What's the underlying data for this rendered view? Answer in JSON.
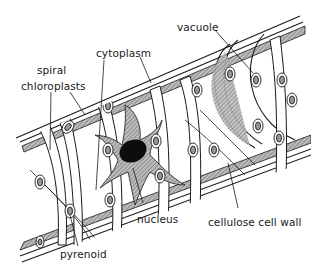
{
  "diagram": {
    "labels": [
      {
        "id": "vacuole",
        "text": "vacuole",
        "x": 22,
        "y": 28
      },
      {
        "id": "cytoplasm",
        "text": "cytoplasm",
        "x": 96,
        "y": 51
      },
      {
        "id": "spiral",
        "text": "spiral",
        "x": 37,
        "y": 68
      },
      {
        "id": "chloroplasts",
        "text": "chloroplasts",
        "x": 21,
        "y": 82
      },
      {
        "id": "nucleus",
        "text": "nucleus",
        "x": 139,
        "y": 217
      },
      {
        "id": "cellulose-cell-wall",
        "text": "cellulose cell wall",
        "x": 209,
        "y": 219
      },
      {
        "id": "pyrenoid",
        "text": "pyrenoid",
        "x": 60,
        "y": 252
      }
    ],
    "colors": {
      "outline": "#1a1a1a",
      "cytoplasm_fill": "#9a9a9a",
      "nucleus_fill": "#0d0d0d",
      "background": "#ffffff"
    }
  }
}
